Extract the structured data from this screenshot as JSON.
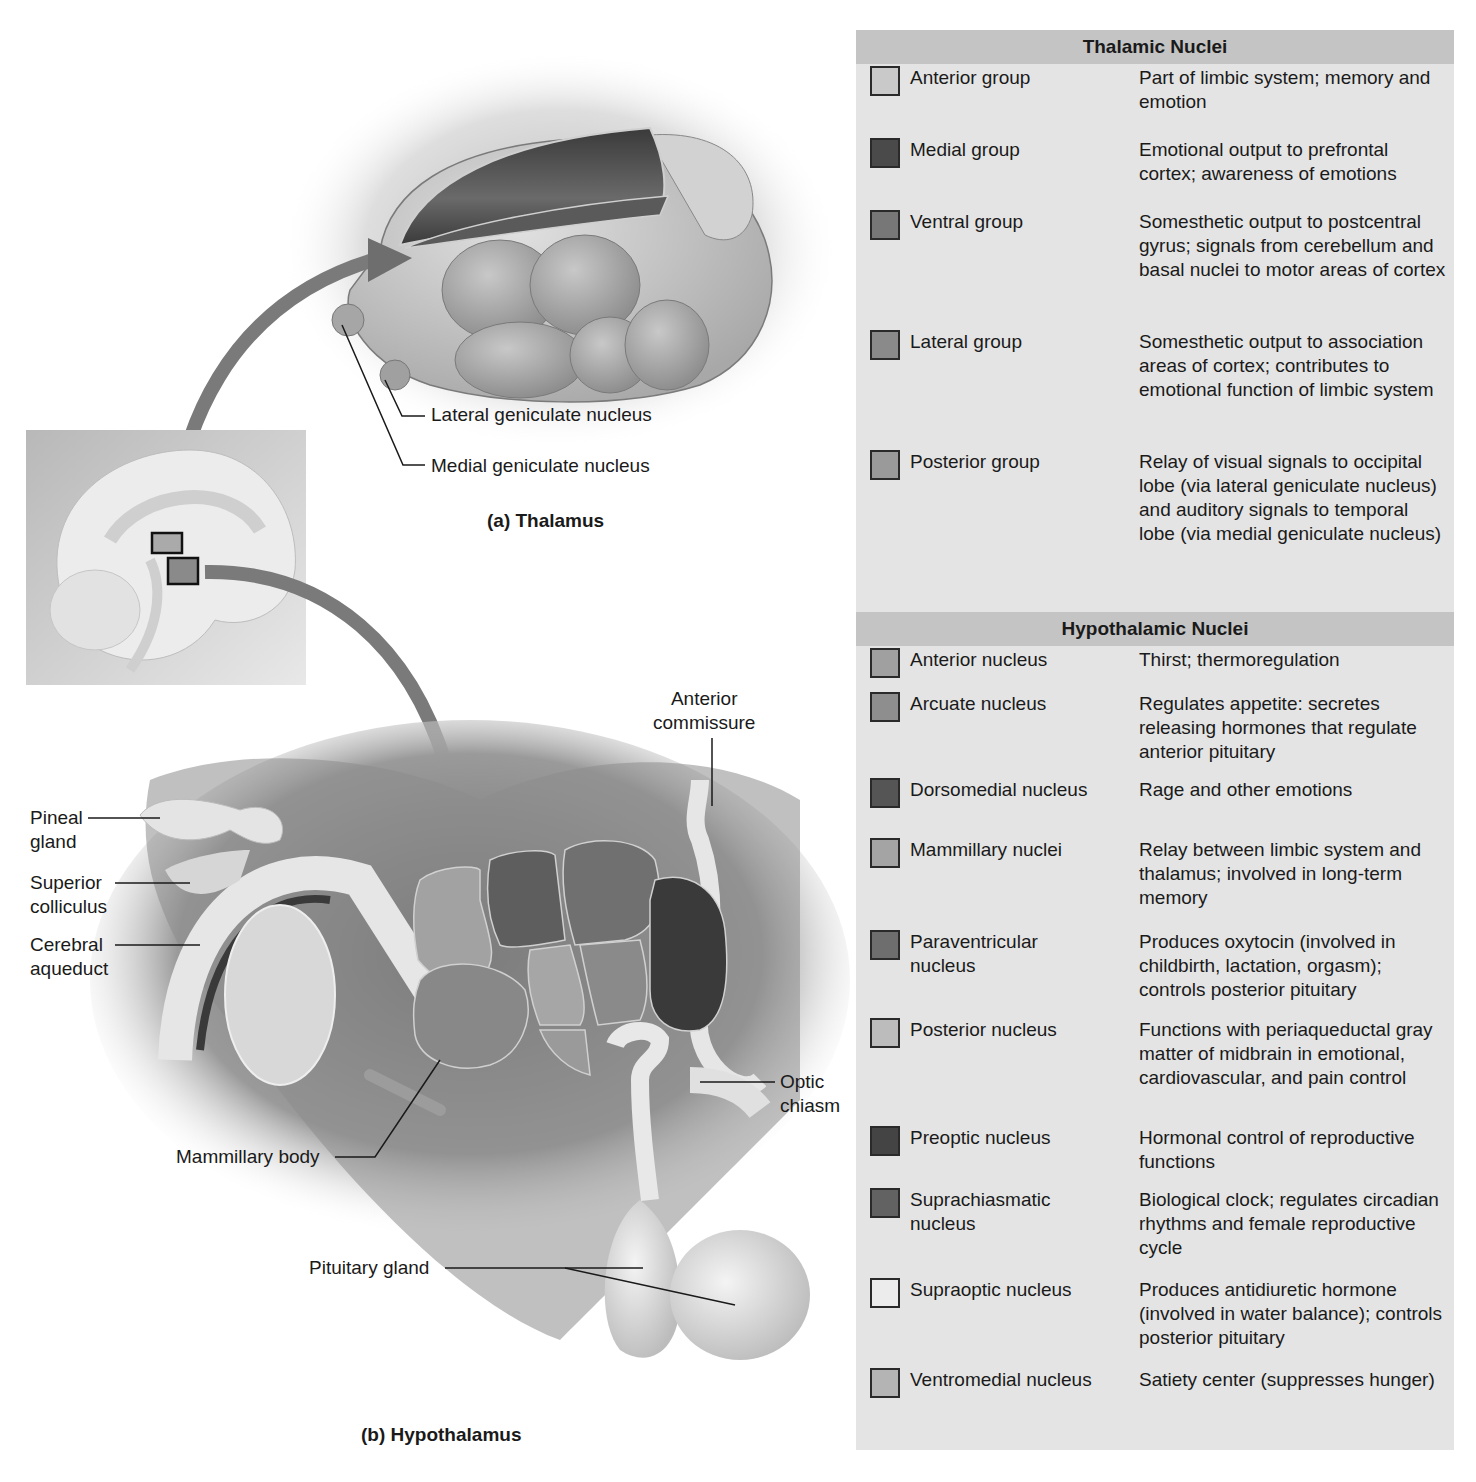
{
  "figure": {
    "thalamus": {
      "caption": "(a) Thalamus",
      "labels": {
        "lateral_geniculate": "Lateral geniculate nucleus",
        "medial_geniculate": "Medial geniculate nucleus"
      }
    },
    "hypothalamus": {
      "caption": "(b) Hypothalamus",
      "labels": {
        "pineal_gland": "Pineal\ngland",
        "superior_colliculus": "Superior\ncolliculus",
        "cerebral_aqueduct": "Cerebral\naqueduct",
        "anterior_commissure": "Anterior\ncommissure",
        "optic_chiasm": "Optic\nchiasm",
        "mammillary_body": "Mammillary body",
        "pituitary_gland": "Pituitary gland"
      }
    },
    "colors": {
      "arrow": "#7a7a7a",
      "table_bg": "#e4e4e4",
      "table_header_bg": "#c4c4c4",
      "swatch_border": "#2a2a2a"
    }
  },
  "table": {
    "thalamic": {
      "title": "Thalamic Nuclei",
      "rows": [
        {
          "name": "Anterior group",
          "desc": "Part of limbic system; memory and emotion",
          "color": "#c9c9c9"
        },
        {
          "name": "Medial group",
          "desc": "Emotional output to prefrontal cortex; awareness of emotions",
          "color": "#4a4a4a"
        },
        {
          "name": "Ventral group",
          "desc": "Somesthetic output to postcentral gyrus; signals from cerebellum and basal nuclei to motor areas of cortex",
          "color": "#777777"
        },
        {
          "name": "Lateral group",
          "desc": "Somesthetic output to association areas of cortex; contributes to emotional function of limbic system",
          "color": "#8a8a8a"
        },
        {
          "name": "Posterior group",
          "desc": "Relay of visual signals to occipital lobe (via lateral geniculate nucleus) and auditory signals to temporal lobe (via medial geniculate nucleus)",
          "color": "#9a9a9a"
        }
      ]
    },
    "hypothalamic": {
      "title": "Hypothalamic Nuclei",
      "rows": [
        {
          "name": "Anterior nucleus",
          "desc": "Thirst; thermoregulation",
          "color": "#a0a0a0"
        },
        {
          "name": "Arcuate nucleus",
          "desc": "Regulates appetite: secretes releasing hormones that regulate anterior pituitary",
          "color": "#8e8e8e"
        },
        {
          "name": "Dorsomedial nucleus",
          "desc": "Rage and other emotions",
          "color": "#555555"
        },
        {
          "name": "Mammillary nuclei",
          "desc": "Relay between limbic system and thalamus; involved in long-term memory",
          "color": "#a4a4a4"
        },
        {
          "name": "Paraventricular nucleus",
          "desc": "Produces oxytocin (involved in childbirth, lactation, orgasm); controls posterior pituitary",
          "color": "#6e6e6e"
        },
        {
          "name": "Posterior nucleus",
          "desc": "Functions with periaqueductal gray matter of midbrain in emotional, cardiovascular, and pain control",
          "color": "#bcbcbc"
        },
        {
          "name": "Preoptic nucleus",
          "desc": "Hormonal control of reproductive functions",
          "color": "#444444"
        },
        {
          "name": "Suprachiasmatic nucleus",
          "desc": "Biological clock; regulates circadian rhythms and female reproductive cycle",
          "color": "#626262"
        },
        {
          "name": "Supraoptic nucleus",
          "desc": "Produces antidiuretic hormone (involved in water balance); controls posterior pituitary",
          "color": "#ececec"
        },
        {
          "name": "Ventromedial nucleus",
          "desc": "Satiety center (suppresses hunger)",
          "color": "#b4b4b4"
        }
      ]
    }
  }
}
